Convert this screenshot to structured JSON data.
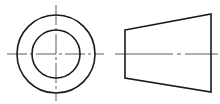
{
  "diagram": {
    "type": "orthographic-projection",
    "colors": {
      "outline": "#1a1a1a",
      "centerline": "#333333",
      "background": "#ffffff"
    },
    "views": [
      {
        "name": "end-view",
        "shapes": [
          "outer-circle",
          "inner-circle",
          "horizontal-centerline",
          "vertical-centerline"
        ],
        "center": [
          56,
          54
        ],
        "outer_radius": 39,
        "inner_radius": 24
      },
      {
        "name": "side-view",
        "shapes": [
          "trapezoid",
          "axis-centerline"
        ],
        "points": [
          [
            125,
            30
          ],
          [
            211,
            14
          ],
          [
            211,
            92
          ],
          [
            125,
            78
          ]
        ]
      }
    ]
  }
}
